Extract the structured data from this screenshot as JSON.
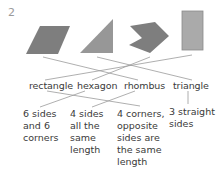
{
  "question_number": "2",
  "colors": {
    "shape_dark": "#7e7e7e",
    "shape_light": "#aaaaaa",
    "line": "#9a9a9a",
    "text": "#3a3a3a"
  },
  "shapes": [
    {
      "id": "parallelogram",
      "semantic": "rhombus-shape"
    },
    {
      "id": "triangle",
      "semantic": "triangle-shape"
    },
    {
      "id": "hexagon",
      "semantic": "hexagon-shape"
    },
    {
      "id": "rectangle",
      "semantic": "rectangle-shape"
    }
  ],
  "names": [
    "rectangle",
    "hexagon",
    "rhombus",
    "triangle"
  ],
  "descriptions": [
    {
      "lines": [
        "6 sides",
        "and 6",
        "corners"
      ]
    },
    {
      "lines": [
        "4 sides",
        "all the",
        "same",
        "length"
      ]
    },
    {
      "lines": [
        "4 corners,",
        "opposite",
        "sides are",
        "the same",
        "length"
      ]
    },
    {
      "lines": [
        "3 straight",
        "sides"
      ]
    }
  ],
  "matches": {
    "shape_to_name": [
      {
        "shape": "parallelogram",
        "name": "rhombus"
      },
      {
        "shape": "triangle",
        "name": "triangle"
      },
      {
        "shape": "hexagon",
        "name": "hexagon"
      },
      {
        "shape": "rectangle",
        "name": "rectangle"
      }
    ],
    "name_to_description": [
      {
        "name": "rectangle",
        "description": "4 corners, opposite sides are the same length"
      },
      {
        "name": "hexagon",
        "description": "6 sides and 6 corners"
      },
      {
        "name": "rhombus",
        "description": "4 sides all the same length"
      },
      {
        "name": "triangle",
        "description": "3 straight sides"
      }
    ]
  }
}
